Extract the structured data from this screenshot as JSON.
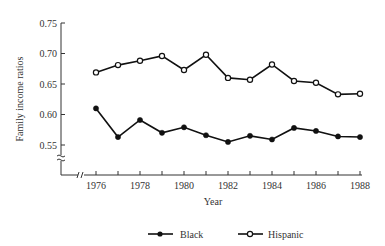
{
  "chart_data": {
    "type": "line",
    "title": "",
    "xlabel": "Year",
    "ylabel": "Family income ratios",
    "x": [
      1976,
      1977,
      1978,
      1979,
      1980,
      1981,
      1982,
      1983,
      1984,
      1985,
      1986,
      1987,
      1988
    ],
    "x_tick_labels": [
      "1976",
      "1978",
      "1980",
      "1982",
      "1984",
      "1986",
      "1988"
    ],
    "y_tick_labels": [
      "0.75",
      "0.70",
      "0.65",
      "0.60",
      "0.55"
    ],
    "ylim": [
      0.55,
      0.75
    ],
    "y_axis_break": true,
    "x_axis_break": true,
    "grid": false,
    "legend_position": "bottom",
    "series": [
      {
        "name": "Black",
        "marker": "filled-circle",
        "values": [
          0.61,
          0.563,
          0.591,
          0.57,
          0.579,
          0.566,
          0.555,
          0.565,
          0.559,
          0.578,
          0.573,
          0.564,
          0.563
        ]
      },
      {
        "name": "Hispanic",
        "marker": "open-circle",
        "values": [
          0.669,
          0.681,
          0.688,
          0.696,
          0.673,
          0.698,
          0.66,
          0.657,
          0.682,
          0.655,
          0.652,
          0.633,
          0.634
        ]
      }
    ]
  },
  "labels": {
    "xlabel": "Year",
    "ylabel": "Family income ratios",
    "legend_black": "Black",
    "legend_hispanic": "Hispanic"
  }
}
